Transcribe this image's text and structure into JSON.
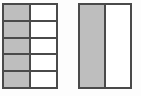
{
  "image": {
    "title": "Two equivalent-fraction area models",
    "background_color": "#fdfdfd",
    "width": 141,
    "height": 96
  },
  "style": {
    "shaded_color": "#bebebe",
    "unshaded_color": "#ffffff",
    "line_color": "#4a4a4a",
    "line_width_px": 2
  },
  "figures": [
    {
      "id": "figure-a",
      "label": "left-rectangle-5x2",
      "rows": 5,
      "columns": 2,
      "total_parts": 10,
      "shaded_parts": 5,
      "fraction": "5/10",
      "shading_pattern": "left column shaded",
      "cells": [
        [
          "shaded",
          "unshaded"
        ],
        [
          "shaded",
          "unshaded"
        ],
        [
          "shaded",
          "unshaded"
        ],
        [
          "shaded",
          "unshaded"
        ],
        [
          "shaded",
          "unshaded"
        ]
      ]
    },
    {
      "id": "figure-b",
      "label": "right-rectangle-1x2",
      "rows": 1,
      "columns": 2,
      "total_parts": 2,
      "shaded_parts": 1,
      "fraction": "1/2",
      "shading_pattern": "left column shaded",
      "cells": [
        [
          "shaded",
          "unshaded"
        ]
      ]
    }
  ]
}
